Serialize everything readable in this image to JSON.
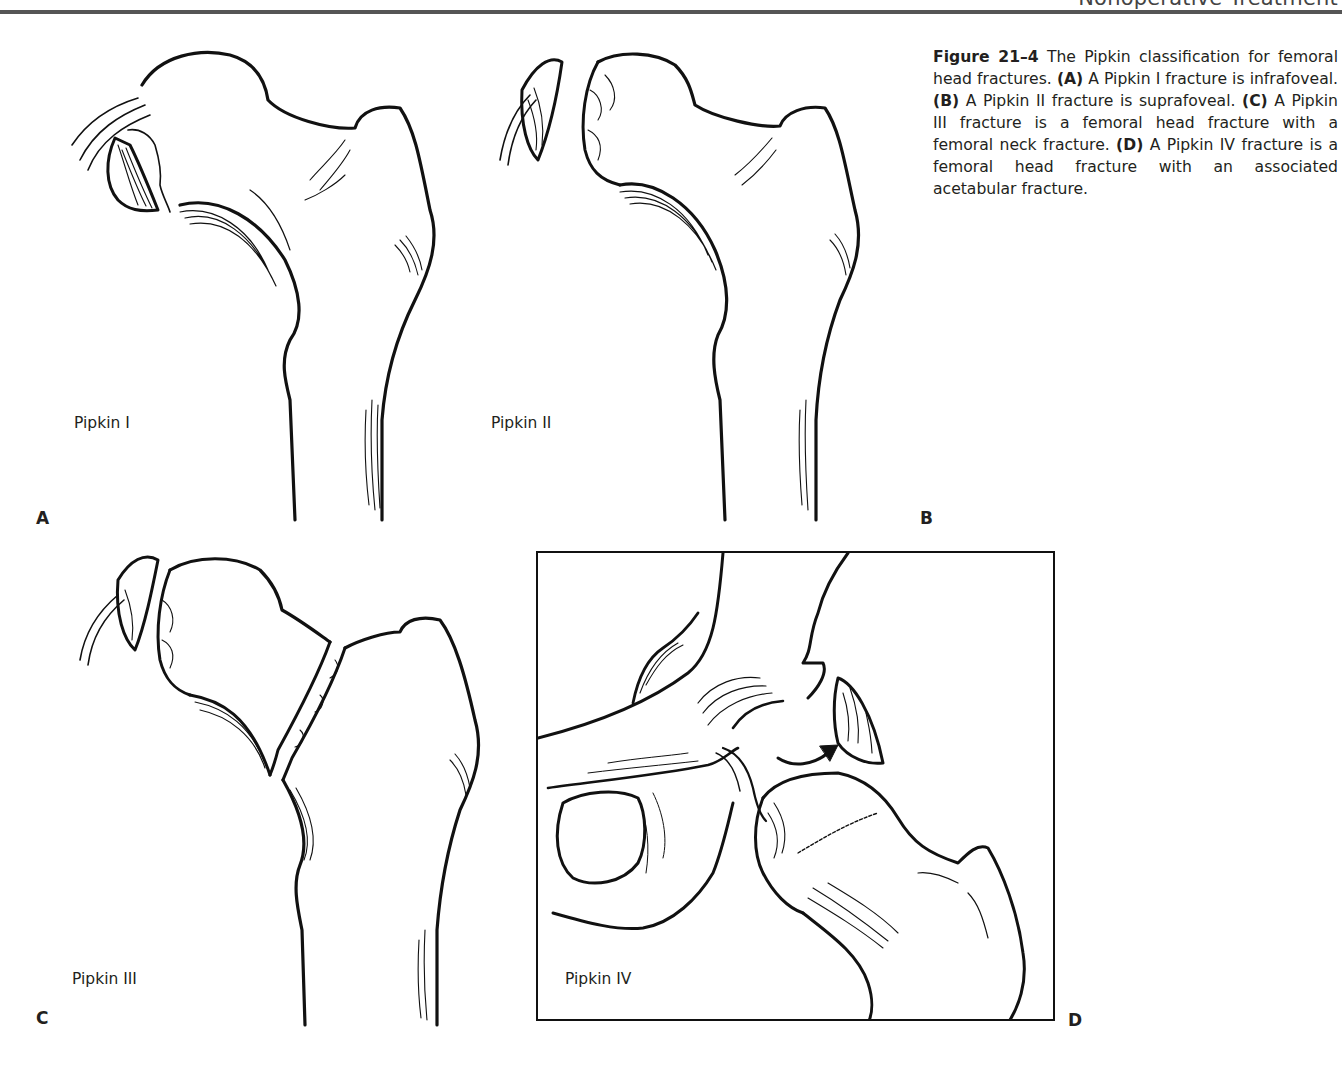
{
  "page": {
    "running_head": "Nonoperative Treatment"
  },
  "figure": {
    "number_label": "Figure 21–4",
    "caption_intro": " The Pipkin classification for femoral head fractures. ",
    "items": [
      {
        "tag": "(A)",
        "text": " A Pipkin I fracture is infrafoveal. "
      },
      {
        "tag": "(B)",
        "text": " A Pipkin II fracture is suprafoveal. "
      },
      {
        "tag": "(C)",
        "text": " A Pipkin III fracture is a femoral head fracture with a femoral neck fracture. "
      },
      {
        "tag": "(D)",
        "text": " A Pipkin IV fracture is a femoral head fracture with an associated acetabular fracture."
      }
    ]
  },
  "panels": [
    {
      "letter": "A",
      "label": "Pipkin I"
    },
    {
      "letter": "B",
      "label": "Pipkin II"
    },
    {
      "letter": "C",
      "label": "Pipkin III"
    },
    {
      "letter": "D",
      "label": "Pipkin IV"
    }
  ]
}
